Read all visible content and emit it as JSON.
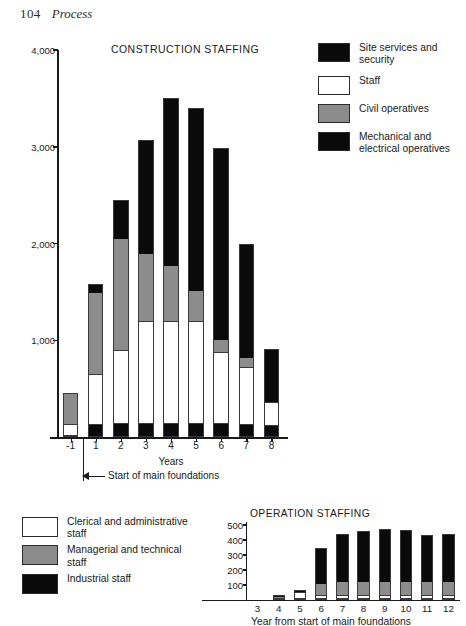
{
  "page": {
    "folio": "104",
    "running_title": "Process"
  },
  "legend_construction": {
    "items": [
      {
        "label": "Site services and security",
        "color": "#0a0a0a",
        "swatch": "black"
      },
      {
        "label": "Staff",
        "color": "#ffffff",
        "swatch": "white"
      },
      {
        "label": "Civil operatives",
        "color": "#8c8c8c",
        "swatch": "gray"
      },
      {
        "label": "Mechanical and electrical operatives",
        "color": "#0a0a0a",
        "swatch": "black"
      }
    ]
  },
  "legend_operation": {
    "items": [
      {
        "label": "Clerical and administrative staff",
        "color": "#ffffff",
        "swatch": "white"
      },
      {
        "label": "Managerial and technical staff",
        "color": "#8c8c8c",
        "swatch": "gray"
      },
      {
        "label": "Industrial staff",
        "color": "#0a0a0a",
        "swatch": "black"
      }
    ]
  },
  "annotation": {
    "start_foundations": "Start of main foundations"
  },
  "chart_data": [
    {
      "type": "bar",
      "stacked": true,
      "title": "CONSTRUCTION STAFFING",
      "xlabel": "Years",
      "ylabel": "",
      "grid": false,
      "legend_position": "right",
      "ylim": [
        0,
        4000
      ],
      "yticks": [
        1000,
        2000,
        3000,
        4000
      ],
      "ytick_labels": [
        "1,000",
        "2,000",
        "3,000",
        "4,000"
      ],
      "categories": [
        "-1",
        "1",
        "2",
        "3",
        "4",
        "5",
        "6",
        "7",
        "8"
      ],
      "series": [
        {
          "name": "Mechanical and electrical operatives",
          "color": "#0a0a0a",
          "values": [
            0,
            120,
            130,
            130,
            130,
            130,
            130,
            120,
            110
          ]
        },
        {
          "name": "Staff",
          "color": "#ffffff",
          "values": [
            130,
            530,
            770,
            1070,
            1070,
            1070,
            740,
            600,
            250
          ]
        },
        {
          "name": "Civil operatives",
          "color": "#8c8c8c",
          "values": [
            320,
            850,
            1150,
            690,
            570,
            310,
            130,
            90,
            0
          ]
        },
        {
          "name": "Site services and security",
          "color": "#0a0a0a",
          "values": [
            0,
            80,
            400,
            1180,
            1730,
            1890,
            1990,
            1180,
            550
          ]
        }
      ],
      "totals": [
        450,
        1580,
        2450,
        3070,
        3500,
        3400,
        2990,
        1990,
        910
      ]
    },
    {
      "type": "bar",
      "stacked": true,
      "title": "OPERATION STAFFING",
      "xlabel": "Year from start of main foundations",
      "ylabel": "",
      "grid": false,
      "legend_position": "left",
      "ylim": [
        0,
        520
      ],
      "yticks": [
        100,
        200,
        300,
        400,
        500
      ],
      "ytick_labels": [
        "100",
        "200",
        "300",
        "400",
        "500"
      ],
      "categories": [
        "3",
        "4",
        "5",
        "6",
        "7",
        "8",
        "9",
        "10",
        "11",
        "12"
      ],
      "series": [
        {
          "name": "Clerical and administrative staff",
          "color": "#ffffff",
          "values": [
            0,
            15,
            55,
            30,
            30,
            30,
            30,
            30,
            30,
            30
          ]
        },
        {
          "name": "Managerial and technical staff",
          "color": "#8c8c8c",
          "values": [
            0,
            5,
            0,
            75,
            85,
            85,
            85,
            85,
            85,
            85
          ]
        },
        {
          "name": "Industrial staff",
          "color": "#0a0a0a",
          "values": [
            0,
            15,
            10,
            240,
            325,
            345,
            360,
            355,
            320,
            325
          ]
        }
      ],
      "totals": [
        0,
        35,
        65,
        345,
        440,
        460,
        475,
        470,
        435,
        440
      ]
    }
  ]
}
